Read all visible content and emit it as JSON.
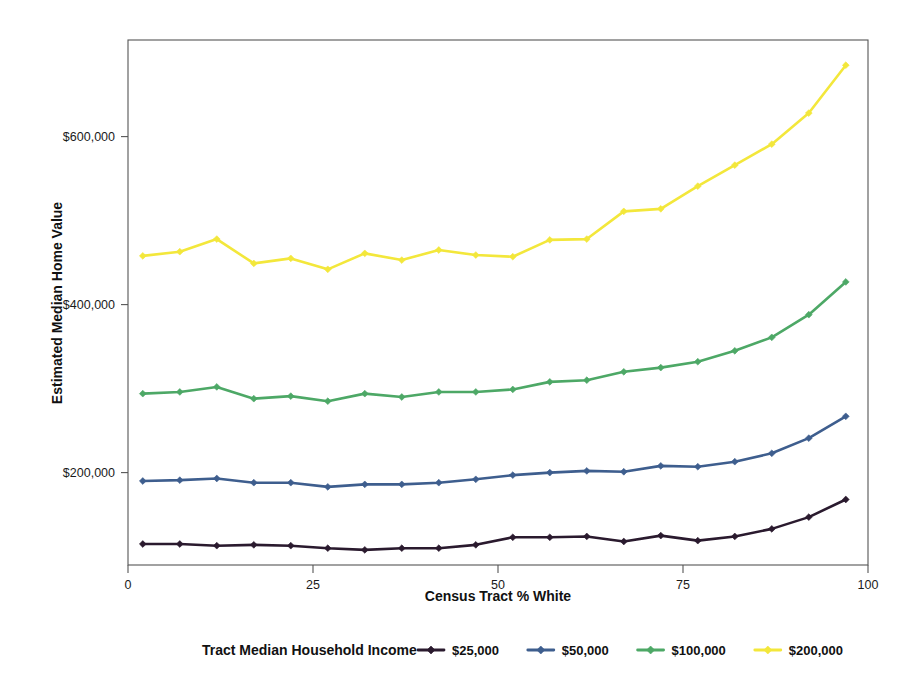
{
  "chart_data": {
    "type": "line",
    "title": "",
    "xlabel": "Census Tract % White",
    "ylabel": "Estimated Median Home Value",
    "xlim": [
      0,
      100
    ],
    "ylim": [
      90000,
      715000
    ],
    "xticks": [
      0,
      25,
      50,
      75,
      100
    ],
    "xtick_labels": [
      "0",
      "25",
      "50",
      "75",
      "100"
    ],
    "yticks": [
      200000,
      400000,
      600000
    ],
    "ytick_labels": [
      "$200,000",
      "$400,000",
      "$600,000"
    ],
    "grid": false,
    "legend_position": "bottom",
    "legend_title": "Tract Median Household Income",
    "marker": "diamond",
    "x": [
      2,
      7,
      12,
      17,
      22,
      27,
      32,
      37,
      42,
      47,
      52,
      57,
      62,
      67,
      72,
      77,
      82,
      87,
      92,
      97
    ],
    "series": [
      {
        "name": "$25,000",
        "color": "#2A1A2E",
        "values": [
          115000,
          115000,
          113000,
          114000,
          113000,
          110000,
          108000,
          110000,
          110000,
          114000,
          123000,
          123000,
          124000,
          118000,
          125000,
          119000,
          124000,
          133000,
          147000,
          168000
        ]
      },
      {
        "name": "$50,000",
        "color": "#3E5E8E",
        "values": [
          190000,
          191000,
          193000,
          188000,
          188000,
          183000,
          186000,
          186000,
          188000,
          192000,
          197000,
          200000,
          202000,
          201000,
          208000,
          207000,
          213000,
          223000,
          241000,
          267000
        ]
      },
      {
        "name": "$100,000",
        "color": "#4DA866",
        "values": [
          294000,
          296000,
          302000,
          288000,
          291000,
          285000,
          294000,
          290000,
          296000,
          296000,
          299000,
          308000,
          310000,
          320000,
          325000,
          332000,
          345000,
          361000,
          388000,
          427000
        ]
      },
      {
        "name": "$200,000",
        "color": "#F3E73B",
        "values": [
          458000,
          463000,
          478000,
          449000,
          455000,
          442000,
          461000,
          453000,
          465000,
          459000,
          457000,
          477000,
          478000,
          511000,
          514000,
          541000,
          566000,
          591000,
          628000,
          685000
        ]
      }
    ]
  }
}
